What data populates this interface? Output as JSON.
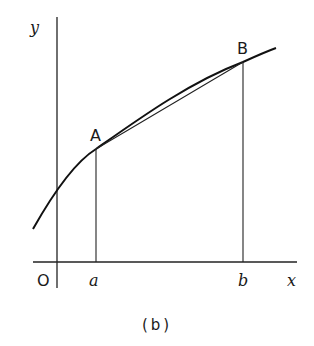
{
  "figure": {
    "caption": "(b)",
    "axes": {
      "y_label": "y",
      "x_label": "x",
      "origin_label": "O"
    },
    "points": {
      "A": {
        "label": "A",
        "x_label": "a"
      },
      "B": {
        "label": "B",
        "x_label": "b"
      }
    }
  }
}
